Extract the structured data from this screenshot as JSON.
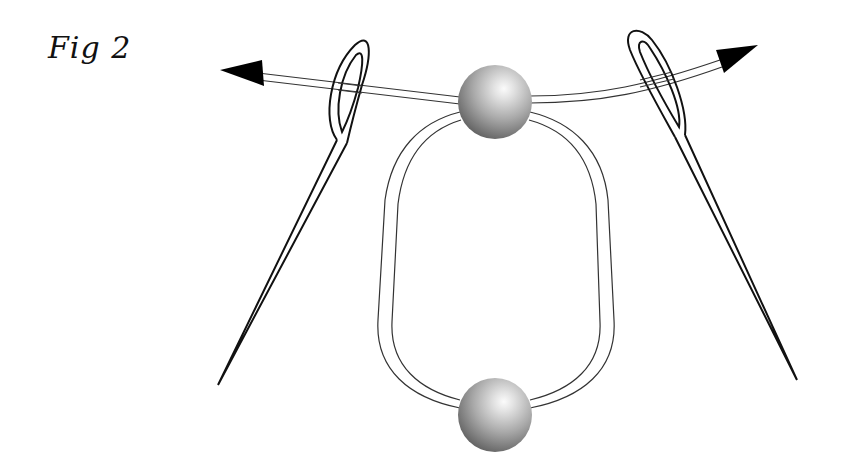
{
  "figure": {
    "title": "Fig 2",
    "elements": {
      "top_bead": {
        "label": "bead",
        "cx": 495,
        "cy": 102,
        "r": 37
      },
      "bottom_bead": {
        "label": "bead",
        "cx": 495,
        "cy": 415,
        "r": 37
      },
      "left_needle": {
        "direction": "left",
        "eye_center": [
          350,
          90
        ],
        "tip": [
          218,
          385
        ]
      },
      "right_needle": {
        "direction": "right",
        "eye_center": [
          654,
          82
        ],
        "tip": [
          797,
          380
        ]
      },
      "left_arrow": {
        "tip": [
          220,
          70
        ],
        "meaning": "pull left"
      },
      "right_arrow": {
        "tip": [
          758,
          45
        ],
        "meaning": "pull right"
      },
      "thread_loop": {
        "type": "double-line thread loop",
        "connects": [
          "top_bead",
          "bottom_bead"
        ]
      }
    },
    "colors": {
      "outline": "#111111",
      "bead_light": "#f4f4f4",
      "bead_mid": "#a8a8a8",
      "bead_dark": "#5a5a5a",
      "background": "#ffffff"
    }
  }
}
